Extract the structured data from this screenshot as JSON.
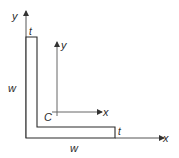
{
  "diagram": {
    "labels": {
      "global_y_axis": "y",
      "global_x_axis": "x",
      "centroid_y_axis": "y",
      "centroid_x_axis": "x",
      "centroid": "C",
      "thickness_top": "t",
      "thickness_right": "t",
      "width_left": "w",
      "width_bottom": "w"
    },
    "colors": {
      "stroke": "#2a2a2a",
      "axis": "#555555",
      "fill": "#ffffff"
    }
  }
}
